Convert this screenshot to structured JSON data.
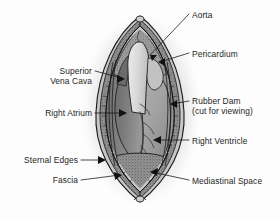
{
  "figure": {
    "type": "anatomical-illustration",
    "style": "grayscale line drawing with halftone stipple",
    "colors": {
      "background": "#fdfdfd",
      "outline": "#1a1a1a",
      "shadow": "#c9c9c9",
      "pericardium_fill": "#9b9b9b",
      "right_atrium_fill": "#8a8a8a",
      "right_ventricle_fill": "#a7a7a7",
      "aorta_fill": "#d4d4d4",
      "fascia_stipple": "#8f8f8f",
      "mediastinal_space": "#8c8c8c",
      "label_text": "#1d1d1d"
    }
  },
  "labels": {
    "aorta": {
      "text": "Aorta",
      "side": "right",
      "x": 192,
      "y": 10
    },
    "pericardium": {
      "text": "Pericardium",
      "side": "right",
      "x": 192,
      "y": 50
    },
    "rubber_dam_line1": {
      "text": "Rubber Dam",
      "side": "right",
      "x": 192,
      "y": 97
    },
    "rubber_dam_line2": {
      "text": "(cut for viewing)",
      "side": "right",
      "x": 192,
      "y": 107
    },
    "right_ventricle": {
      "text": "Right Ventricle",
      "side": "right",
      "x": 192,
      "y": 137
    },
    "mediastinal_space": {
      "text": "Mediastinal Space",
      "side": "right",
      "x": 192,
      "y": 177
    },
    "superior_vena_cava_line1": {
      "text": "Superior",
      "side": "left",
      "x": 93,
      "y": 68
    },
    "superior_vena_cava_line2": {
      "text": "Vena Cava",
      "side": "left",
      "x": 93,
      "y": 78
    },
    "right_atrium": {
      "text": "Right Atrium",
      "side": "left",
      "x": 93,
      "y": 110
    },
    "sternal_edges": {
      "text": "Sternal Edges",
      "side": "left",
      "x": 79,
      "y": 157
    },
    "fascia": {
      "text": "Fascia",
      "side": "left",
      "x": 79,
      "y": 177
    }
  },
  "structures": [
    {
      "name": "aorta",
      "label": "Aorta"
    },
    {
      "name": "pericardium",
      "label": "Pericardium"
    },
    {
      "name": "rubber-dam",
      "label": "Rubber Dam (cut for viewing)"
    },
    {
      "name": "right-ventricle",
      "label": "Right Ventricle"
    },
    {
      "name": "mediastinal-space",
      "label": "Mediastinal Space"
    },
    {
      "name": "superior-vena-cava",
      "label": "Superior Vena Cava"
    },
    {
      "name": "right-atrium",
      "label": "Right Atrium"
    },
    {
      "name": "sternal-edges",
      "label": "Sternal Edges"
    },
    {
      "name": "fascia",
      "label": "Fascia"
    }
  ]
}
